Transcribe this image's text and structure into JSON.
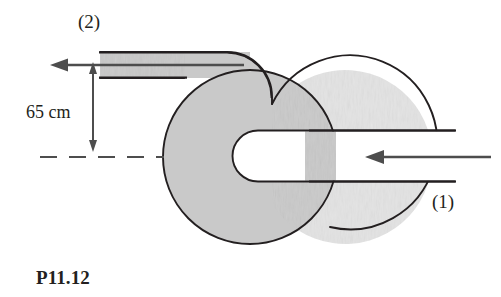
{
  "figure": {
    "caption": "P11.12",
    "labels": {
      "outlet": "(2)",
      "inlet": "(1)"
    },
    "dimension": {
      "text": "65 cm",
      "value": 65,
      "unit": "cm"
    },
    "colors": {
      "fill": "#c9c9c9",
      "outline": "#231f20",
      "arrow": "#4d4d4d",
      "background": "#ffffff",
      "text": "#231f20"
    },
    "geometry": {
      "circle": {
        "cx": 250,
        "cy": 157,
        "r": 87
      },
      "outlet_pipe": {
        "x_start": 100,
        "x_end": 272,
        "y_top": 52,
        "y_bottom": 78,
        "corner_radius": 44
      },
      "inlet_pipe": {
        "x_start": 262,
        "x_end": 455,
        "y_top": 130,
        "y_bottom": 182
      },
      "inner_channel": {
        "cap_cx": 258,
        "cap_r": 26,
        "y_top": 130,
        "y_bottom": 182
      },
      "centerline": {
        "y": 157,
        "x_start": 40,
        "x_end": 164
      },
      "dimension_line": {
        "x": 93,
        "y_top": 64,
        "y_bottom": 150
      },
      "outlet_arrow": {
        "y": 65,
        "x_tail": 244,
        "x_head": 52
      },
      "inlet_arrow": {
        "y": 157,
        "x_tail": 491,
        "x_head": 366
      }
    }
  }
}
